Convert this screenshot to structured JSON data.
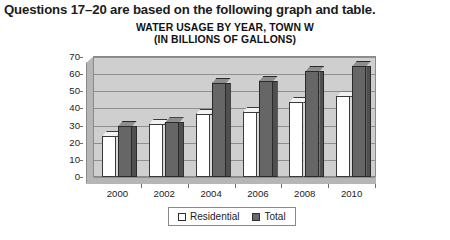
{
  "question_heading": "Questions 17–20 are based on the following graph and table.",
  "chart_data": {
    "type": "bar",
    "title_line1": "WATER USAGE BY YEAR, TOWN W",
    "title_line2": "(IN BILLIONS OF GALLONS)",
    "title": "WATER USAGE BY YEAR, TOWN W (IN BILLIONS OF GALLONS)",
    "xlabel": "",
    "ylabel": "",
    "categories": [
      "2000",
      "2002",
      "2004",
      "2006",
      "2008",
      "2010"
    ],
    "series": [
      {
        "name": "Residential",
        "values": [
          24,
          31,
          37,
          38,
          44,
          47
        ],
        "color": "#ffffff"
      },
      {
        "name": "Total",
        "values": [
          30,
          32,
          55,
          56,
          62,
          65
        ],
        "color": "#666666"
      }
    ],
    "ylim": [
      0,
      70
    ],
    "yticks": [
      "0",
      "10",
      "20",
      "30",
      "40",
      "50",
      "60",
      "70"
    ],
    "grid": true,
    "legend_position": "bottom",
    "legend": [
      "Residential",
      "Total"
    ]
  }
}
